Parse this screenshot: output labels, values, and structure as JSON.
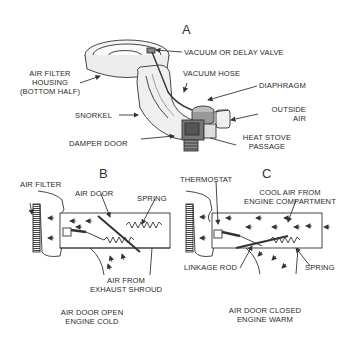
{
  "diagram": {
    "panels": [
      {
        "id": "A",
        "letter": "A",
        "labels": {
          "vacuum_valve": "VACUUM OR DELAY VALVE",
          "air_filter_housing": [
            "AIR FILTER",
            "HOUSING",
            "(BOTTOM HALF)"
          ],
          "vacuum_hose": "VACUUM HOSE",
          "diaphragm": "DIAPHRAGM",
          "outside_air": [
            "OUTSIDE",
            "AIR"
          ],
          "snorkel": "SNORKEL",
          "damper_door": "DAMPER DOOR",
          "heat_stove_passage": [
            "HEAT STOVE",
            "PASSAGE"
          ]
        }
      },
      {
        "id": "B",
        "letter": "B",
        "labels": {
          "air_filter": "AIR FILTER",
          "air_door": "AIR DOOR",
          "spring": "SPRING",
          "air_from_exhaust": [
            "AIR FROM",
            "EXHAUST SHROUD"
          ]
        },
        "caption": [
          "AIR DOOR OPEN",
          "ENGINE COLD"
        ]
      },
      {
        "id": "C",
        "letter": "C",
        "labels": {
          "thermostat": "THERMOSTAT",
          "cool_air": [
            "COOL AIR FROM",
            "ENGINE COMPARTMENT"
          ],
          "linkage_rod": "LINKAGE ROD",
          "spring": "SPRING"
        },
        "caption": [
          "AIR DOOR CLOSED",
          "ENGINE WARM"
        ]
      }
    ]
  }
}
